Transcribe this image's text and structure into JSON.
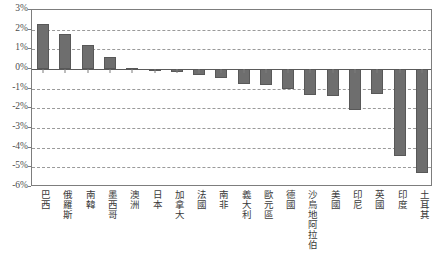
{
  "chart_data": {
    "type": "bar",
    "title": "",
    "subtitle": "",
    "xlabel": "",
    "ylabel": "",
    "ylim": [
      -6,
      3
    ],
    "ytick_step": 1,
    "ytick_labels": [
      "3%",
      "2%",
      "1%",
      "0%",
      "-1%",
      "-2%",
      "-3%",
      "-4%",
      "-5%",
      "-6%"
    ],
    "ytick_values": [
      3,
      2,
      1,
      0,
      -1,
      -2,
      -3,
      -4,
      -5,
      -6
    ],
    "grid": true,
    "grid_style": "dashed-horizontal",
    "legend": "none",
    "orientation": "vertical",
    "bar_color": "#6e6e6e",
    "bar_border_color": "#585858",
    "axis_color": "#7d7d7d",
    "grid_color": "#9a9a9a",
    "zero_line": 0,
    "categories": [
      "巴西",
      "俄羅斯",
      "南韓",
      "墨西哥",
      "澳洲",
      "日本",
      "加拿大",
      "法國",
      "南非",
      "義大利",
      "歐元區",
      "德國",
      "沙烏地阿拉伯",
      "美國",
      "印尼",
      "英國",
      "印度",
      "土耳其"
    ],
    "values": [
      2.3,
      1.8,
      1.2,
      0.6,
      0.05,
      -0.05,
      -0.15,
      -0.3,
      -0.45,
      -0.75,
      -0.8,
      -1.0,
      -1.3,
      -1.35,
      -2.1,
      -1.25,
      -4.4,
      -5.3
    ],
    "value_labels": [
      "2.3%",
      "1.8%",
      "1.2%",
      "0.6%",
      "0.05%",
      "-0.05%",
      "-0.15%",
      "-0.3%",
      "-0.45%",
      "-0.75%",
      "-0.8%",
      "-1.0%",
      "-1.3%",
      "-1.35%",
      "-2.1%",
      "-1.25%",
      "-4.4%",
      "-5.3%"
    ]
  }
}
